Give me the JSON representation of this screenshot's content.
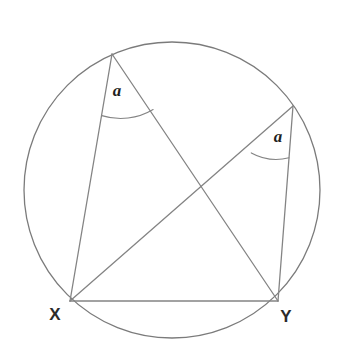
{
  "figure": {
    "background_color": "#ffffff",
    "stroke_color": "#848484",
    "label_color": "#2b2b2b",
    "width": 339,
    "height": 354
  },
  "circle": {
    "name": "circumscribed-circle",
    "center_x": 172,
    "center_y": 190,
    "radius": 148,
    "stroke": "#7b7b7b"
  },
  "points": {
    "top_vertex": {
      "label": "",
      "x": 112,
      "y": 54
    },
    "right_vertex": {
      "label": "",
      "x": 293,
      "y": 106
    },
    "x_vertex": {
      "label": "X",
      "x": 70,
      "y": 301,
      "label_x": 55,
      "label_y": 320
    },
    "y_vertex": {
      "label": "Y",
      "x": 278,
      "y": 301,
      "label_x": 286,
      "label_y": 322
    },
    "intersection": {
      "label": "",
      "x": 199,
      "y": 188
    }
  },
  "segments": [
    {
      "name": "segment-top-to-x",
      "x1": 112,
      "y1": 54,
      "x2": 70,
      "y2": 301
    },
    {
      "name": "segment-top-to-y",
      "x1": 112,
      "y1": 54,
      "x2": 278,
      "y2": 301
    },
    {
      "name": "segment-right-to-x",
      "x1": 293,
      "y1": 106,
      "x2": 70,
      "y2": 301
    },
    {
      "name": "segment-right-to-y",
      "x1": 293,
      "y1": 106,
      "x2": 278,
      "y2": 301
    },
    {
      "name": "chord-x-to-y",
      "x1": 70,
      "y1": 301,
      "x2": 278,
      "y2": 301
    }
  ],
  "angles": [
    {
      "name": "angle-at-top-vertex",
      "label": "a",
      "label_x": 117,
      "label_y": 96,
      "arc_path": "M 101.8 115.6 A 63 63 0 0 0 153.1 109.5"
    },
    {
      "name": "angle-at-right-vertex",
      "label": "a",
      "label_x": 278,
      "label_y": 142,
      "arc_path": "M 251.3 152.9 A 52 52 0 0 0 289.0 157.8"
    }
  ]
}
